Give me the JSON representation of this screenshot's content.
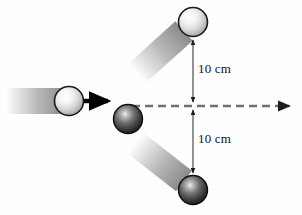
{
  "figure": {
    "type": "physics-collision-diagram",
    "width": 302,
    "height": 215,
    "background_color": "#fefefe"
  },
  "labels": {
    "upper_distance": "10 cm",
    "lower_distance": "10 cm"
  },
  "colors": {
    "light_ball_edge": "#1a1a1a",
    "light_ball_fill": "#f2f2f2",
    "light_ball_shade": "#9a9a9a",
    "dark_ball_edge": "#0d0d0d",
    "dark_ball_fill": "#6e6e6e",
    "dark_ball_shade": "#1c1c1c",
    "trail_color": "#8c8c8c",
    "dashed_line": "#707070",
    "solid_arrow": "#000000",
    "dimension_line": "#5a5a5a",
    "text": "#111111"
  },
  "objects": {
    "incoming_ball": {
      "name": "incoming-white-ball",
      "shade": "light",
      "cx": 69,
      "cy": 101,
      "r": 14
    },
    "target_ball": {
      "name": "target-dark-ball",
      "shade": "dark",
      "cx": 128,
      "cy": 119,
      "r": 14
    },
    "deflected_upper_ball": {
      "name": "deflected-white-ball",
      "shade": "light",
      "cx": 193,
      "cy": 22,
      "r": 14
    },
    "deflected_lower_ball": {
      "name": "deflected-dark-ball",
      "shade": "dark",
      "cx": 193,
      "cy": 190,
      "r": 14
    }
  },
  "trails": {
    "incoming_trail": {
      "x1": 8,
      "y1": 101,
      "x2": 60,
      "y2": 101,
      "width": 26,
      "angle_deg": 0
    },
    "upper_trail": {
      "x1": 136,
      "y1": 75,
      "x2": 184,
      "y2": 31,
      "width": 26,
      "angle_deg": -42
    },
    "lower_trail": {
      "x1": 138,
      "y1": 145,
      "x2": 184,
      "y2": 181,
      "width": 26,
      "angle_deg": 38
    }
  },
  "arrows": {
    "velocity_arrow": {
      "name": "velocity-arrow",
      "x1": 84,
      "y1": 101,
      "x2": 112,
      "y2": 101,
      "style": "solid-black"
    },
    "axis_arrow": {
      "name": "horizontal-axis-arrow",
      "x1": 132,
      "y1": 106,
      "x2": 293,
      "y2": 106,
      "style": "dashed-gray"
    }
  },
  "dimensions": {
    "origin": {
      "x": 193,
      "y": 106
    },
    "upper": {
      "from_y": 106,
      "to_y": 38,
      "value": "10 cm"
    },
    "lower": {
      "from_y": 106,
      "to_y": 175,
      "value": "10 cm"
    }
  }
}
